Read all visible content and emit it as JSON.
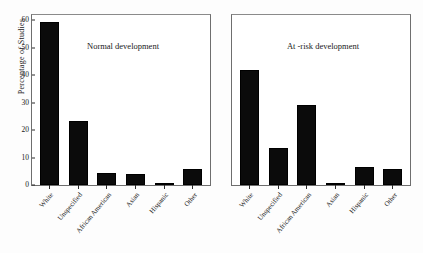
{
  "chart_data": {
    "type": "bar",
    "title": "",
    "xlabel": "",
    "ylabel": "Percentage of Studies",
    "ylim": [
      0,
      62
    ],
    "yticks": [
      0,
      10,
      20,
      30,
      40,
      50,
      60
    ],
    "grid": false,
    "legend": "none",
    "categories": [
      "White",
      "Unspecified",
      "African American",
      "Asian",
      "Hispanic",
      "Other"
    ],
    "panels": [
      {
        "title": "Normal development",
        "values": [
          59.5,
          23.5,
          4.5,
          4.0,
          0.7,
          6.0
        ],
        "show_yaxis_labels": true
      },
      {
        "title": "At -risk development",
        "values": [
          42.0,
          13.5,
          29.0,
          0.5,
          6.5,
          6.0
        ],
        "show_yaxis_labels": false
      }
    ],
    "bar_color": "#0b0b0b",
    "axis_color": "#2b2b2b"
  }
}
